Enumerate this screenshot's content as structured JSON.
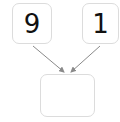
{
  "diagram": {
    "type": "number-bond",
    "parts": [
      {
        "label": "9"
      },
      {
        "label": "1"
      }
    ],
    "whole": {
      "label": ""
    },
    "colors": {
      "box_border": "#dcdcdc",
      "arrow": "#8a8a8a",
      "text": "#111111"
    }
  }
}
